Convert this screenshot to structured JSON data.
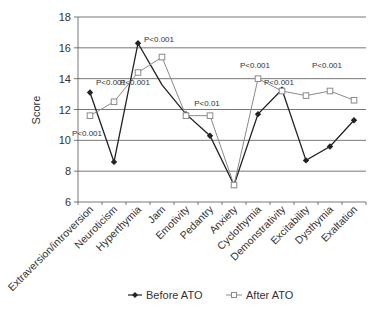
{
  "chart_data": {
    "type": "line",
    "title": "",
    "xlabel": "",
    "ylabel": "Score",
    "ylim": [
      6,
      18
    ],
    "yticks": [
      6,
      8,
      10,
      12,
      14,
      16,
      18
    ],
    "grid": true,
    "legend_position": "bottom",
    "categories": [
      "Extraversion/introversion",
      "Neuroticism",
      "Hyperthymia",
      "Jam",
      "Emotivity",
      "Pedantry",
      "Anxiety",
      "Cyclothymia",
      "Demonstrativity",
      "Excitability",
      "Dysthymia",
      "Exaltation"
    ],
    "series": [
      {
        "name": "Before ATO",
        "marker": "diamond-filled",
        "color": "#222222",
        "values": [
          13.1,
          8.6,
          16.3,
          13.6,
          11.7,
          10.3,
          7.1,
          11.7,
          13.3,
          8.7,
          9.6,
          11.3
        ]
      },
      {
        "name": "After ATO",
        "marker": "square-open",
        "color": "#8a8a8a",
        "values": [
          11.6,
          12.5,
          14.4,
          15.4,
          11.6,
          11.6,
          7.1,
          14.0,
          13.2,
          12.9,
          13.2,
          12.6
        ]
      }
    ],
    "annotations": [
      {
        "text": "P<0.001",
        "x": "Extraversion/introversion",
        "y": 10.3
      },
      {
        "text": "P<0.001",
        "x": "Neuroticism",
        "y": 13.6
      },
      {
        "text": "P<0.001",
        "x": "Hyperthymia",
        "y": 13.6
      },
      {
        "text": "P<0.001",
        "x": "Jam",
        "y": 16.4
      },
      {
        "text": "P<0.01",
        "x": "Pedantry",
        "y": 12.2
      },
      {
        "text": "P<0.001",
        "x": "Cyclothymia",
        "y": 14.7
      },
      {
        "text": "P<0.001",
        "x": "Demonstrativity",
        "y": 13.6
      },
      {
        "text": "P<0.001",
        "x": "Dysthymia",
        "y": 14.7
      }
    ]
  },
  "legend": {
    "before_label": "Before ATO",
    "after_label": "After ATO"
  },
  "axis": {
    "y_label": "Score"
  }
}
